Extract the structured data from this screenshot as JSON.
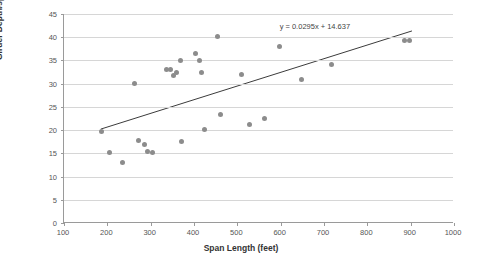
{
  "chart_data": {
    "type": "scatter",
    "title": "",
    "xlabel": "Span Length (feet)",
    "ylabel": "Girder Depth/span Ratio at tower (1:)",
    "xlim": [
      100,
      1000
    ],
    "ylim": [
      0,
      45
    ],
    "xticks": [
      100,
      200,
      300,
      400,
      500,
      600,
      700,
      800,
      900,
      1000
    ],
    "yticks": [
      0,
      5,
      10,
      15,
      20,
      25,
      30,
      35,
      40,
      45
    ],
    "grid": "horizontal",
    "legend": "none",
    "annotations": [
      {
        "name": "trendline-equation",
        "text": "y = 0.0295x + 14.637"
      }
    ],
    "trendline": {
      "slope": 0.0295,
      "intercept": 14.637,
      "x_start": 185,
      "x_end": 905
    },
    "points": [
      {
        "x": 186,
        "y": 19.6
      },
      {
        "x": 205,
        "y": 15.2
      },
      {
        "x": 235,
        "y": 13.0
      },
      {
        "x": 262,
        "y": 30.0
      },
      {
        "x": 272,
        "y": 17.8
      },
      {
        "x": 285,
        "y": 17.0
      },
      {
        "x": 292,
        "y": 15.5
      },
      {
        "x": 305,
        "y": 15.2
      },
      {
        "x": 337,
        "y": 33.0
      },
      {
        "x": 345,
        "y": 33.0
      },
      {
        "x": 352,
        "y": 31.8
      },
      {
        "x": 360,
        "y": 32.5
      },
      {
        "x": 368,
        "y": 35.0
      },
      {
        "x": 372,
        "y": 17.5
      },
      {
        "x": 404,
        "y": 36.5
      },
      {
        "x": 412,
        "y": 35.0
      },
      {
        "x": 418,
        "y": 32.3
      },
      {
        "x": 424,
        "y": 20.2
      },
      {
        "x": 455,
        "y": 40.2
      },
      {
        "x": 462,
        "y": 23.3
      },
      {
        "x": 510,
        "y": 32.0
      },
      {
        "x": 527,
        "y": 21.3
      },
      {
        "x": 563,
        "y": 22.5
      },
      {
        "x": 598,
        "y": 38.0
      },
      {
        "x": 648,
        "y": 30.8
      },
      {
        "x": 718,
        "y": 34.2
      },
      {
        "x": 886,
        "y": 39.2
      },
      {
        "x": 898,
        "y": 39.4
      }
    ]
  }
}
